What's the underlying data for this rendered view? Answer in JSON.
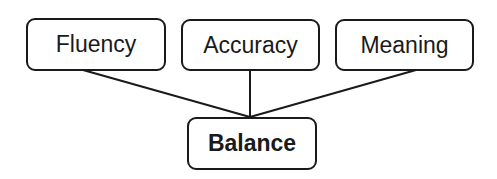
{
  "diagram": {
    "top_nodes": [
      {
        "label": "Fluency"
      },
      {
        "label": "Accuracy"
      },
      {
        "label": "Meaning"
      }
    ],
    "bottom_node": {
      "label": "Balance"
    },
    "colors": {
      "stroke": "#1a1a1a",
      "background": "#ffffff"
    }
  }
}
